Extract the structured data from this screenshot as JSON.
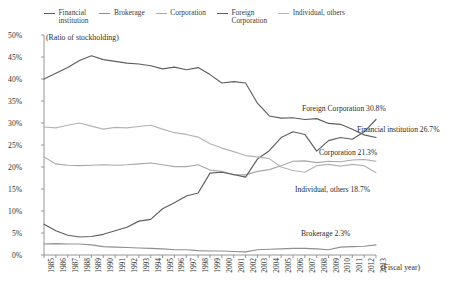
{
  "legend": {
    "items": [
      {
        "label": "Financial\ninstitution",
        "color": "#5e5e5e"
      },
      {
        "label": "Brokerage",
        "color": "#8f8f8f"
      },
      {
        "label": "Corporation",
        "color": "#a8a8a8"
      },
      {
        "label": "Foreign\nCorporation",
        "color": "#5e5e5e"
      },
      {
        "label": "Individual, others",
        "color": "#b4b4b4"
      }
    ]
  },
  "axis": {
    "y_note": "(Ratio of stockholding)",
    "x_note": "(Fiscal year)",
    "y_ticks": [
      "0%",
      "5%",
      "10%",
      "15%",
      "20%",
      "25%",
      "30%",
      "35%",
      "40%",
      "45%",
      "50%"
    ]
  },
  "annotations": [
    {
      "text": "Foreign Corporation 30.8%",
      "x": 302,
      "y": 104
    },
    {
      "text": "Financial institution 26.7%",
      "x": 357,
      "y": 125
    },
    {
      "text": "Corporation 21.3%",
      "x": 319,
      "y": 148
    },
    {
      "text": "Individual, others 18.7%",
      "x": 295,
      "y": 185
    },
    {
      "text": "Brokerage 2.3%",
      "x": 301,
      "y": 229
    }
  ],
  "chart_data": {
    "type": "line",
    "title": "",
    "xlabel": "(Fiscal year)",
    "ylabel": "(Ratio of stockholding)",
    "ylim": [
      0,
      50
    ],
    "ytick_step": 5,
    "grid": false,
    "legend_position": "top",
    "x": [
      1985,
      1986,
      1987,
      1988,
      1989,
      1990,
      1991,
      1992,
      1993,
      1994,
      1995,
      1996,
      1997,
      1998,
      1999,
      2000,
      2001,
      2002,
      2003,
      2004,
      2005,
      2006,
      2007,
      2008,
      2009,
      2010,
      2011,
      2012,
      2013
    ],
    "series": [
      {
        "name": "Financial institution",
        "color": "#5e5e5e",
        "end_label": "Financial institution 26.7%",
        "values": [
          40.0,
          41.3,
          42.6,
          44.2,
          45.3,
          44.4,
          44.0,
          43.6,
          43.4,
          43.0,
          42.3,
          42.7,
          42.1,
          42.6,
          41.0,
          39.1,
          39.4,
          39.1,
          34.5,
          31.6,
          31.1,
          31.2,
          30.8,
          31.0,
          29.9,
          29.7,
          28.6,
          27.3,
          26.7
        ]
      },
      {
        "name": "Brokerage",
        "color": "#8f8f8f",
        "end_label": "Brokerage 2.3%",
        "values": [
          2.5,
          2.6,
          2.5,
          2.5,
          2.3,
          1.9,
          1.8,
          1.7,
          1.6,
          1.5,
          1.4,
          1.2,
          1.2,
          1.0,
          0.9,
          0.9,
          0.8,
          0.7,
          1.2,
          1.3,
          1.4,
          1.5,
          1.5,
          1.4,
          1.2,
          1.8,
          1.9,
          2.0,
          2.3
        ]
      },
      {
        "name": "Corporation",
        "color": "#a8a8a8",
        "end_label": "Corporation 21.3%",
        "values": [
          22.3,
          20.7,
          20.4,
          20.3,
          20.4,
          20.5,
          20.4,
          20.5,
          20.7,
          20.9,
          20.5,
          20.1,
          20.1,
          20.5,
          19.3,
          19.0,
          18.2,
          18.2,
          19.0,
          19.4,
          20.3,
          21.3,
          21.4,
          21.0,
          21.3,
          21.2,
          21.6,
          21.7,
          21.3
        ]
      },
      {
        "name": "Foreign Corporation",
        "color": "#5e5e5e",
        "end_label": "Foreign Corporation 30.8%",
        "values": [
          7.0,
          5.5,
          4.5,
          4.1,
          4.2,
          4.7,
          5.5,
          6.3,
          7.7,
          8.1,
          10.5,
          11.9,
          13.4,
          14.1,
          18.6,
          18.8,
          18.3,
          17.7,
          21.8,
          23.7,
          26.7,
          28.0,
          27.4,
          23.6,
          26.0,
          26.7,
          26.3,
          28.0,
          30.8
        ]
      },
      {
        "name": "Individual, others",
        "color": "#b4b4b4",
        "end_label": "Individual, others 18.7%",
        "values": [
          29.1,
          28.9,
          29.5,
          30.0,
          29.3,
          28.6,
          29.0,
          28.9,
          29.2,
          29.5,
          28.6,
          27.8,
          27.4,
          26.8,
          25.3,
          24.3,
          23.5,
          22.6,
          22.3,
          21.9,
          20.0,
          19.2,
          18.8,
          20.3,
          20.6,
          20.2,
          20.6,
          20.3,
          18.7
        ]
      }
    ]
  }
}
